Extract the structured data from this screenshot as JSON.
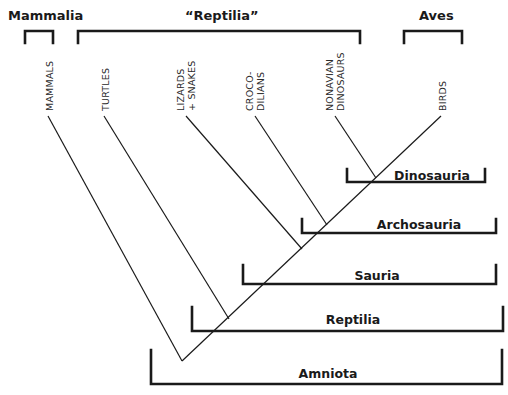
{
  "top_groups": [
    {
      "id": "mammalia",
      "label": "Mammalia",
      "label_x": 8,
      "label_y": 20,
      "bracket": {
        "x1": 25,
        "x2": 53,
        "y_top": 31,
        "y_bottom": 43
      }
    },
    {
      "id": "reptilia-paraphyletic",
      "label": "“Reptilia”",
      "label_x": 185,
      "label_y": 20,
      "bracket": {
        "x1": 78,
        "x2": 360,
        "y_top": 31,
        "y_bottom": 43
      }
    },
    {
      "id": "aves",
      "label": "Aves",
      "label_x": 419,
      "label_y": 20,
      "bracket": {
        "x1": 404,
        "x2": 462,
        "y_top": 31,
        "y_bottom": 43
      }
    }
  ],
  "taxa": [
    {
      "id": "mammals",
      "lines": [
        "MAMMALS"
      ],
      "tip": [
        48,
        116
      ],
      "text_x": 53,
      "text_y": 111
    },
    {
      "id": "turtles",
      "lines": [
        "TURTLES"
      ],
      "tip": [
        104,
        116
      ],
      "text_x": 109,
      "text_y": 111
    },
    {
      "id": "lizards-snakes",
      "lines": [
        "LIZARDS",
        "+ SNAKES"
      ],
      "tip": [
        186,
        116
      ],
      "text_x": 184,
      "text_y": 111
    },
    {
      "id": "crocodilians",
      "lines": [
        "CROCO-",
        "DILIANS"
      ],
      "tip": [
        255,
        116
      ],
      "text_x": 253,
      "text_y": 111
    },
    {
      "id": "nonavian-dinosaurs",
      "lines": [
        "NONAVIAN",
        "DINOSAURS"
      ],
      "tip": [
        335,
        116
      ],
      "text_x": 333,
      "text_y": 111
    },
    {
      "id": "birds",
      "lines": [
        "BIRDS"
      ],
      "tip": [
        441,
        116
      ],
      "text_x": 446,
      "text_y": 111
    }
  ],
  "tree": {
    "root": [
      182,
      361
    ],
    "spine_end": [
      441,
      116
    ],
    "mammal_branch_end": [
      48,
      116
    ],
    "branches": [
      {
        "taxon": "turtles",
        "from": [
          104,
          116
        ],
        "to": [
          229,
          319
        ]
      },
      {
        "taxon": "lizards-snakes",
        "from": [
          186,
          116
        ],
        "to": [
          302,
          249
        ]
      },
      {
        "taxon": "crocodilians",
        "from": [
          255,
          116
        ],
        "to": [
          327,
          225
        ]
      },
      {
        "taxon": "nonavian-dinosaurs",
        "from": [
          335,
          116
        ],
        "to": [
          376,
          178
        ]
      }
    ]
  },
  "clades": [
    {
      "id": "dinosauria",
      "label": "Dinosauria",
      "x1": 347,
      "x2": 485,
      "y_top": 169,
      "y_bottom": 182,
      "label_x": 432,
      "label_y": 180
    },
    {
      "id": "archosauria",
      "label": "Archosauria",
      "x1": 302,
      "x2": 496,
      "y_top": 219,
      "y_bottom": 233,
      "label_x": 419,
      "label_y": 229
    },
    {
      "id": "sauria",
      "label": "Sauria",
      "x1": 243,
      "x2": 496,
      "y_top": 265,
      "y_bottom": 284,
      "label_x": 377,
      "label_y": 280
    },
    {
      "id": "reptilia",
      "label": "Reptilia",
      "x1": 192,
      "x2": 503,
      "y_top": 307,
      "y_bottom": 331,
      "label_x": 353,
      "label_y": 324
    },
    {
      "id": "amniota",
      "label": "Amniota",
      "x1": 151,
      "x2": 502,
      "y_top": 350,
      "y_bottom": 384,
      "label_x": 328,
      "label_y": 378
    }
  ],
  "colors": {
    "ink": "#1a1a1a",
    "background": "#ffffff"
  }
}
